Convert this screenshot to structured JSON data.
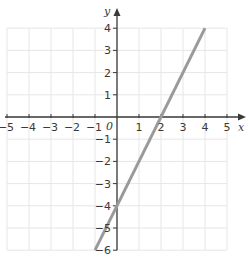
{
  "chart_data": {
    "type": "line",
    "title": "",
    "xlabel": "x",
    "ylabel": "y",
    "origin_label": "0",
    "xlim": [
      -5,
      5
    ],
    "ylim": [
      -6,
      4
    ],
    "grid": true,
    "x_ticks": [
      -5,
      -4,
      -3,
      -2,
      -1,
      1,
      2,
      3,
      4,
      5
    ],
    "y_ticks": [
      4,
      3,
      2,
      1,
      -1,
      -2,
      -3,
      -4,
      -5,
      -6
    ],
    "series": [
      {
        "name": "y = 2x - 4",
        "x": [
          -1,
          4
        ],
        "y": [
          -6,
          4
        ],
        "color": "#9a9a9a"
      }
    ]
  },
  "colors": {
    "grid": "#e6e6e6",
    "axis": "#3a3a3a",
    "line": "#9a9a9a"
  }
}
